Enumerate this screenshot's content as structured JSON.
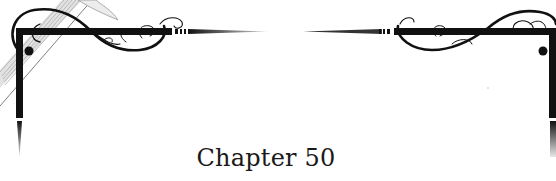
{
  "heading": {
    "title": "Chapter 50"
  },
  "ornament": {
    "style": "flourish-corner-frame",
    "stroke_color": "#111111",
    "sketch_color": "#8a8a8a",
    "background": "#ffffff"
  }
}
